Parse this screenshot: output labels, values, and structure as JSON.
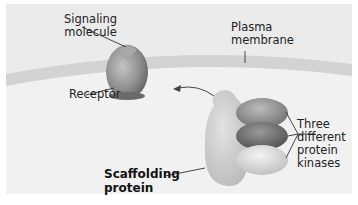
{
  "labels": {
    "signaling_molecule": [
      "Signaling",
      "molecule"
    ],
    "plasma_membrane": [
      "Plasma",
      "membrane"
    ],
    "receptor": "Receptor",
    "kinases": [
      "Three",
      "different",
      "protein",
      "kinases"
    ],
    "scaffolding_protein": [
      "Scaffolding",
      "protein"
    ]
  },
  "colors": {
    "background": "#ebebeb",
    "membrane": "#d3d3d3",
    "cytoplasm": "#f1f1f1",
    "receptor": "#8e8e8e",
    "scaffold": "#c9c9c9",
    "kinase_top": "#8f8f8f",
    "kinase_middle": "#6e6e6e",
    "kinase_bottom": "#d8d8d8",
    "leader_line": "#333333"
  }
}
